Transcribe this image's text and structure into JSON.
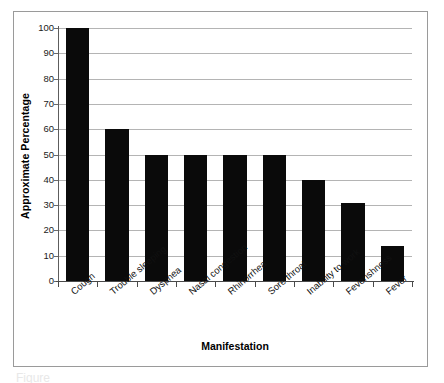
{
  "figure": {
    "caption_fragment": "Figure",
    "frame_color": "#9a9a9a",
    "background": "#ffffff"
  },
  "chart_data": {
    "type": "bar",
    "title": "",
    "xlabel": "Manifestation",
    "ylabel": "Approximate Percentage",
    "categories": [
      "Cough",
      "Trouble sleeping",
      "Dyspnea",
      "Nasal congestion",
      "Rhinorrhea",
      "Sore throat",
      "Inability to work",
      "Feverishness",
      "Fever"
    ],
    "values": [
      100,
      60,
      50,
      50,
      50,
      50,
      40,
      31,
      14
    ],
    "ylim": [
      0,
      100
    ],
    "ytick_labels": [
      "100",
      "90",
      "80",
      "70",
      "60",
      "50",
      "40",
      "30",
      "20",
      "10",
      "0"
    ],
    "ytick_values": [
      100,
      90,
      80,
      70,
      60,
      50,
      40,
      30,
      20,
      10,
      0
    ],
    "grid": true,
    "grid_axis": "y",
    "legend": false,
    "bar_color": "#0a0a0a",
    "grid_color": "#b4b4b4",
    "axis_color": "#4a4a4a"
  }
}
